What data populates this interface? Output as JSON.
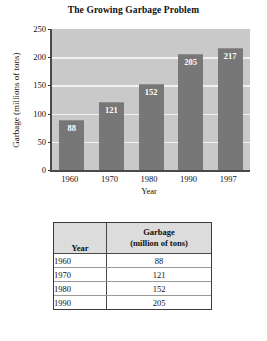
{
  "chart_data": {
    "type": "bar",
    "title": "The Growing Garbage Problem",
    "xlabel": "Year",
    "ylabel": "Garbage (millions of tons)",
    "categories": [
      "1960",
      "1970",
      "1980",
      "1990",
      "1997"
    ],
    "values": [
      88,
      121,
      152,
      205,
      217
    ],
    "ylim": [
      0,
      250
    ],
    "yticks": [
      0,
      50,
      100,
      150,
      200,
      250
    ],
    "ytick_labels": [
      "0",
      "50",
      "100",
      "150",
      "200",
      "250"
    ],
    "grid": true,
    "legend": "none",
    "data_labels": [
      "88",
      "121",
      "152",
      "205",
      "217"
    ],
    "bar_color": "#777777",
    "plot_background": "#c9c9c9",
    "gridline_color": "#f2f2f2",
    "label_color": "#ffffff"
  },
  "table": {
    "headers": {
      "year": "Year",
      "garbage_line1": "Garbage",
      "garbage_line2": "(million of tons)"
    },
    "rows": [
      {
        "year": "1960",
        "value": "88"
      },
      {
        "year": "1970",
        "value": "121"
      },
      {
        "year": "1980",
        "value": "152"
      },
      {
        "year": "1990",
        "value": "205"
      }
    ]
  }
}
